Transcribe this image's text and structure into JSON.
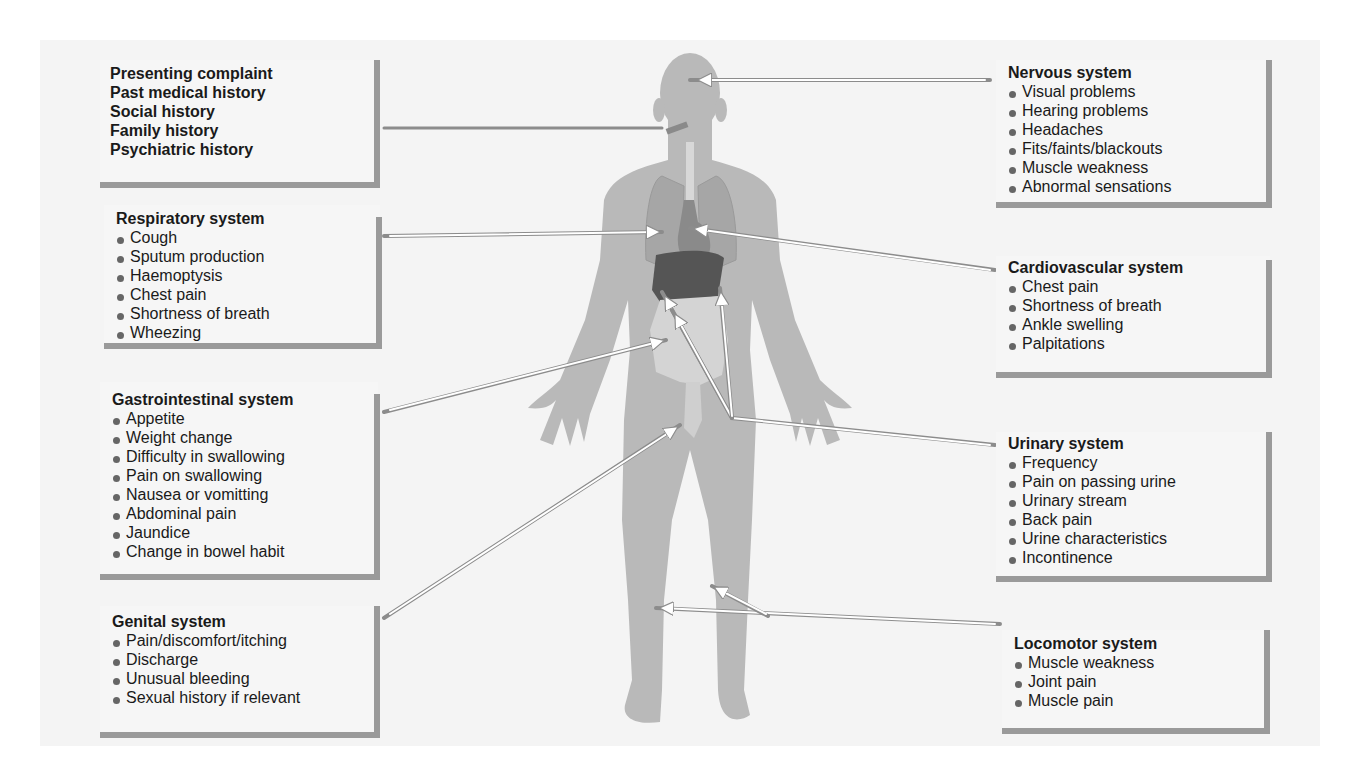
{
  "colors": {
    "panel_bg": "#f4f4f4",
    "box_shadow": "#9a9a9a",
    "body_fill": "#b9b9b9",
    "lung_fill": "#a6a6a6",
    "heart_fill": "#8a8a8a",
    "liver_fill": "#555555",
    "gut_fill": "#d4d4d4",
    "arrow_fill": "#ffffff",
    "arrow_stroke": "#8c8c8c"
  },
  "history_box": {
    "items": [
      "Presenting complaint",
      "Past medical history",
      "Social history",
      "Family history",
      "Psychiatric history"
    ]
  },
  "systems": {
    "respiratory": {
      "title": "Respiratory system",
      "items": [
        "Cough",
        "Sputum production",
        "Haemoptysis",
        "Chest pain",
        "Shortness of breath",
        "Wheezing"
      ]
    },
    "gastrointestinal": {
      "title": "Gastrointestinal system",
      "items": [
        "Appetite",
        "Weight change",
        "Difficulty in swallowing",
        "Pain on swallowing",
        "Nausea or vomitting",
        "Abdominal pain",
        "Jaundice",
        "Change in bowel habit"
      ]
    },
    "genital": {
      "title": "Genital system",
      "items": [
        "Pain/discomfort/itching",
        "Discharge",
        "Unusual bleeding",
        "Sexual history if relevant"
      ]
    },
    "nervous": {
      "title": "Nervous system",
      "items": [
        "Visual problems",
        "Hearing problems",
        "Headaches",
        "Fits/faints/blackouts",
        "Muscle weakness",
        "Abnormal sensations"
      ]
    },
    "cardiovascular": {
      "title": "Cardiovascular system",
      "items": [
        "Chest pain",
        "Shortness of breath",
        "Ankle swelling",
        "Palpitations"
      ]
    },
    "urinary": {
      "title": "Urinary system",
      "items": [
        "Frequency",
        "Pain on passing urine",
        "Urinary stream",
        "Back pain",
        "Urine characteristics",
        "Incontinence"
      ]
    },
    "locomotor": {
      "title": "Locomotor system",
      "items": [
        "Muscle weakness",
        "Joint pain",
        "Muscle pain"
      ]
    }
  }
}
